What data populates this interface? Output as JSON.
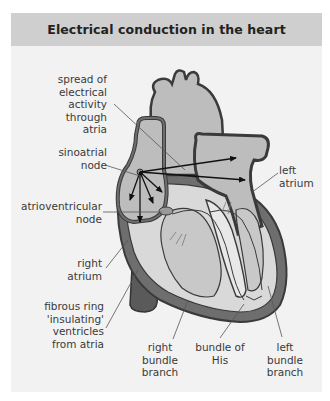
{
  "figure": {
    "title": "Electrical conduction in the heart",
    "colors": {
      "header_bg": "#cfcfcf",
      "panel_bg": "#f2f2f2",
      "heart_fill": "#bdbdbd",
      "heart_wall": "#6e6e6e",
      "outline": "#3a3a3a",
      "vessel_dark": "#5a5a5a"
    },
    "labels": {
      "spread": [
        "spread of",
        "electrical",
        "activity",
        "through",
        "atria"
      ],
      "sa_node": [
        "sinoatrial",
        "node"
      ],
      "av_node": [
        "atrioventricular",
        "node"
      ],
      "right_atrium": [
        "right",
        "atrium"
      ],
      "fibrous_ring": [
        "fibrous ring",
        "'insulating'",
        "ventricles",
        "from atria"
      ],
      "right_bundle": [
        "right",
        "bundle",
        "branch"
      ],
      "bundle_his": [
        "bundle of",
        "His"
      ],
      "left_bundle": [
        "left",
        "bundle",
        "branch"
      ],
      "left_atrium": [
        "left",
        "atrium"
      ]
    }
  }
}
